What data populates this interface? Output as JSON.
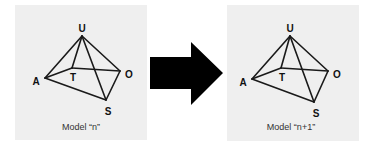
{
  "panels": [
    {
      "caption": "Model “n”",
      "nodes": [
        "U",
        "A",
        "T",
        "O",
        "S"
      ],
      "edges": [
        [
          "U",
          "A"
        ],
        [
          "U",
          "T"
        ],
        [
          "U",
          "O"
        ],
        [
          "U",
          "S"
        ],
        [
          "A",
          "T"
        ],
        [
          "T",
          "O"
        ],
        [
          "A",
          "S"
        ],
        [
          "O",
          "S"
        ]
      ]
    },
    {
      "caption": "Model “n+1”",
      "nodes": [
        "U",
        "A",
        "T",
        "O",
        "S"
      ],
      "edges": [
        [
          "U",
          "A"
        ],
        [
          "U",
          "T"
        ],
        [
          "U",
          "O"
        ],
        [
          "U",
          "S"
        ],
        [
          "A",
          "T"
        ],
        [
          "T",
          "O"
        ],
        [
          "A",
          "S"
        ],
        [
          "O",
          "S"
        ]
      ]
    }
  ],
  "arrow": {
    "direction": "right",
    "color": "#000000"
  }
}
